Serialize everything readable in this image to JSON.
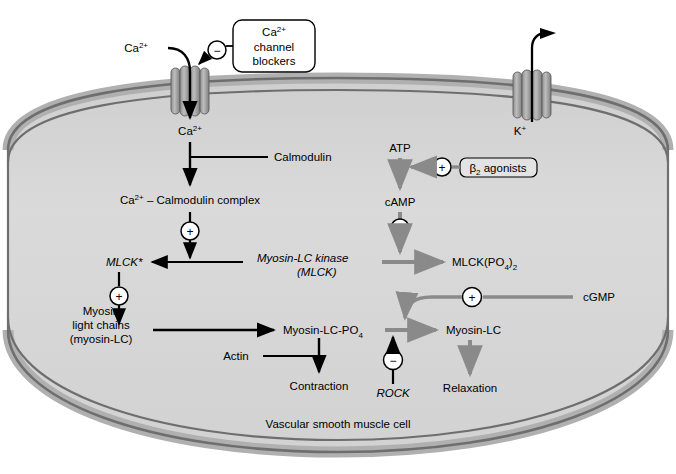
{
  "figure": {
    "cell_label": "Vascular smooth muscle cell",
    "colors": {
      "cell_fill": "#d7d7d7",
      "membrane_outer": "#b9b9b9",
      "membrane_line": "#6e6e6e",
      "channel_fill": "#9a9a9a",
      "black_arrow": "#000000",
      "gray_arrow": "#8a8a8a",
      "background": "#ffffff"
    }
  },
  "channels": [
    {
      "id": "ca-channel",
      "ion_outside": "Ca2+",
      "ion_inside": "Ca2+",
      "direction": "influx"
    },
    {
      "id": "k-channel",
      "ion_inside": "K+",
      "direction": "efflux"
    }
  ],
  "drug_boxes": [
    {
      "id": "ca-channel-blockers",
      "lines": [
        "Ca2+",
        "channel",
        "blockers"
      ],
      "sign": "minus",
      "target": "ca-channel"
    },
    {
      "id": "beta2-agonists",
      "lines": [
        "B2 agonists"
      ],
      "sign": "plus",
      "target": "atp-to-camp"
    }
  ],
  "nodes": {
    "ca_outside": "Ca2+",
    "ca_inside": "Ca2+",
    "k_inside": "K+",
    "calmodulin": "Calmodulin",
    "ca_calmodulin_complex": "Ca2+ - Calmodulin complex",
    "mlck_active": "MLCK*",
    "mlck_kinase_line1": "Myosin-LC kinase",
    "mlck_kinase_line2": "(MLCK)",
    "mlck_po4_2": "MLCK(PO4)2",
    "atp": "ATP",
    "camp": "cAMP",
    "beta2_agonists": "B2 agonists",
    "myosin_lc_line1": "Myosin",
    "myosin_lc_line2": "light chains",
    "myosin_lc_line3": "(myosin-LC)",
    "myosin_lc_po4": "Myosin-LC-PO4",
    "myosin_lc": "Myosin-LC",
    "actin": "Actin",
    "contraction": "Contraction",
    "relaxation": "Relaxation",
    "rock": "ROCK",
    "cgmp": "cGMP"
  },
  "signs": {
    "ca_blocker_sign": "−",
    "calmodulin_complex_to_mlck_sign": "+",
    "mlck_to_myosin_sign": "+",
    "beta2_sign": "+",
    "camp_sign": "+",
    "cgmp_sign": "+",
    "rock_sign": "−"
  },
  "edges": [
    {
      "from": "Ca2+ (extracellular)",
      "to": "Ca2+ (intracellular)",
      "style": "black"
    },
    {
      "from": "Calmodulin",
      "to": "Ca2+ - Calmodulin complex",
      "style": "black"
    },
    {
      "from": "Ca2+ - Calmodulin complex",
      "to": "MLCK*",
      "style": "black",
      "modifier": "+"
    },
    {
      "from": "Myosin-LC kinase (MLCK)",
      "to": "MLCK*",
      "style": "black"
    },
    {
      "from": "Myosin-LC kinase (MLCK)",
      "to": "MLCK(PO4)2",
      "style": "gray"
    },
    {
      "from": "ATP",
      "to": "cAMP",
      "style": "gray"
    },
    {
      "from": "B2 agonists",
      "to": "ATP->cAMP",
      "style": "gray",
      "modifier": "+"
    },
    {
      "from": "cAMP",
      "to": "MLCK(PO4)2",
      "style": "gray",
      "modifier": "+"
    },
    {
      "from": "MLCK*",
      "to": "Myosin light chains -> Myosin-LC-PO4",
      "style": "black",
      "modifier": "+"
    },
    {
      "from": "Myosin light chains (myosin-LC)",
      "to": "Myosin-LC-PO4",
      "style": "black"
    },
    {
      "from": "Actin",
      "to": "Contraction",
      "style": "black"
    },
    {
      "from": "Myosin-LC-PO4",
      "to": "Contraction",
      "style": "black"
    },
    {
      "from": "Myosin-LC-PO4",
      "to": "Myosin-LC",
      "style": "gray"
    },
    {
      "from": "cGMP",
      "to": "Myosin-LC-PO4 -> Myosin-LC",
      "style": "gray",
      "modifier": "+"
    },
    {
      "from": "ROCK",
      "to": "Myosin-LC-PO4 -> Myosin-LC",
      "style": "black",
      "modifier": "-"
    },
    {
      "from": "Myosin-LC",
      "to": "Relaxation",
      "style": "gray"
    }
  ]
}
